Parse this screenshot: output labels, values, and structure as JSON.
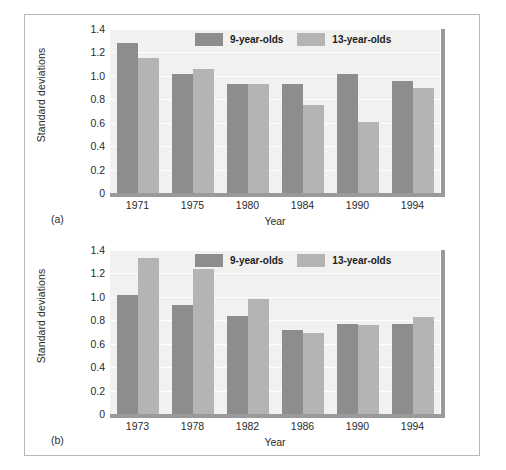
{
  "figure": {
    "panels": [
      {
        "tag": "(a)",
        "xlabel": "Year",
        "ylabel": "Standard deviations",
        "legend": [
          {
            "label": "9-year-olds",
            "color": "#8d8d8d"
          },
          {
            "label": "13-year-olds",
            "color": "#b4b4b4"
          }
        ]
      },
      {
        "tag": "(b)",
        "xlabel": "Year",
        "ylabel": "Standard deviations",
        "legend": [
          {
            "label": "9-year-olds",
            "color": "#8d8d8d"
          },
          {
            "label": "13-year-olds",
            "color": "#b4b4b4"
          }
        ]
      }
    ]
  },
  "chart_data": [
    {
      "type": "bar",
      "panel": "(a)",
      "title": "",
      "xlabel": "Year",
      "ylabel": "Standard deviations",
      "categories": [
        "1971",
        "1975",
        "1980",
        "1984",
        "1990",
        "1994"
      ],
      "series": [
        {
          "name": "9-year-olds",
          "color": "#8d8d8d",
          "values": [
            1.28,
            1.02,
            0.93,
            0.93,
            1.02,
            0.96
          ]
        },
        {
          "name": "13-year-olds",
          "color": "#b4b4b4",
          "values": [
            1.15,
            1.06,
            0.93,
            0.75,
            0.61,
            0.9
          ]
        }
      ],
      "ylim": [
        0,
        1.4
      ],
      "yticks": [
        "1.4",
        "1.2",
        "1.0",
        "0.8",
        "0.6",
        "0.4",
        "0.2",
        "0"
      ],
      "ytick_values": [
        1.4,
        1.2,
        1.0,
        0.8,
        0.6,
        0.4,
        0.2,
        0
      ],
      "grid": true,
      "legend_position": "top-right"
    },
    {
      "type": "bar",
      "panel": "(b)",
      "title": "",
      "xlabel": "Year",
      "ylabel": "Standard deviations",
      "categories": [
        "1973",
        "1978",
        "1982",
        "1986",
        "1990",
        "1994"
      ],
      "series": [
        {
          "name": "9-year-olds",
          "color": "#8d8d8d",
          "values": [
            1.02,
            0.93,
            0.84,
            0.72,
            0.77,
            0.77
          ]
        },
        {
          "name": "13-year-olds",
          "color": "#b4b4b4",
          "values": [
            1.33,
            1.24,
            0.98,
            0.69,
            0.76,
            0.83
          ]
        }
      ],
      "ylim": [
        0,
        1.4
      ],
      "yticks": [
        "1.4",
        "1.2",
        "1.0",
        "0.8",
        "0.6",
        "0.4",
        "0.2",
        "0"
      ],
      "ytick_values": [
        1.4,
        1.2,
        1.0,
        0.8,
        0.6,
        0.4,
        0.2,
        0
      ],
      "grid": true,
      "legend_position": "top-right"
    }
  ]
}
